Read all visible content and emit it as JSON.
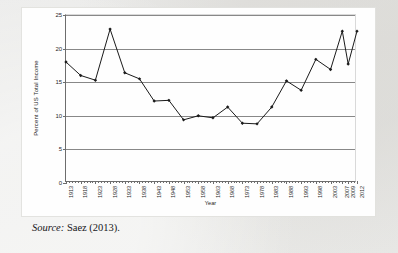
{
  "figure": {
    "caption_prefix": "Source:",
    "caption_text": " Saez (2013)."
  },
  "chart_data": {
    "type": "line",
    "title": "",
    "xlabel": "Year",
    "ylabel": "Percent of US Total Income",
    "xlim": [
      1913,
      2012
    ],
    "ylim": [
      0,
      25
    ],
    "yticks": [
      0,
      5,
      10,
      15,
      20,
      25
    ],
    "xticks": [
      1913,
      1918,
      1923,
      1928,
      1933,
      1938,
      1943,
      1948,
      1953,
      1958,
      1963,
      1968,
      1973,
      1978,
      1983,
      1988,
      1993,
      1998,
      2003,
      2007,
      2009,
      2012
    ],
    "xtick_labels": [
      "1913",
      "1918",
      "1923",
      "1928",
      "1933",
      "1938",
      "1943",
      "1948",
      "1953",
      "1958",
      "1963",
      "1968",
      "1973",
      "1978",
      "1983",
      "1988",
      "1993",
      "1998",
      "2003",
      "2007",
      "2009",
      "2012"
    ],
    "grid": "horizontal",
    "legend": "none",
    "marker": "diamond",
    "line_color": "#1a1a1a",
    "marker_color": "#1a1a1a",
    "x": [
      1913,
      1918,
      1923,
      1928,
      1933,
      1938,
      1943,
      1948,
      1953,
      1958,
      1963,
      1968,
      1973,
      1978,
      1983,
      1988,
      1993,
      1998,
      2003,
      2007,
      2009,
      2012
    ],
    "values": [
      18.0,
      16.0,
      15.3,
      22.9,
      16.4,
      15.5,
      12.2,
      12.3,
      9.4,
      10.0,
      9.7,
      11.3,
      8.9,
      8.8,
      11.3,
      15.2,
      13.8,
      18.4,
      16.9,
      22.6,
      17.7,
      22.6
    ]
  }
}
